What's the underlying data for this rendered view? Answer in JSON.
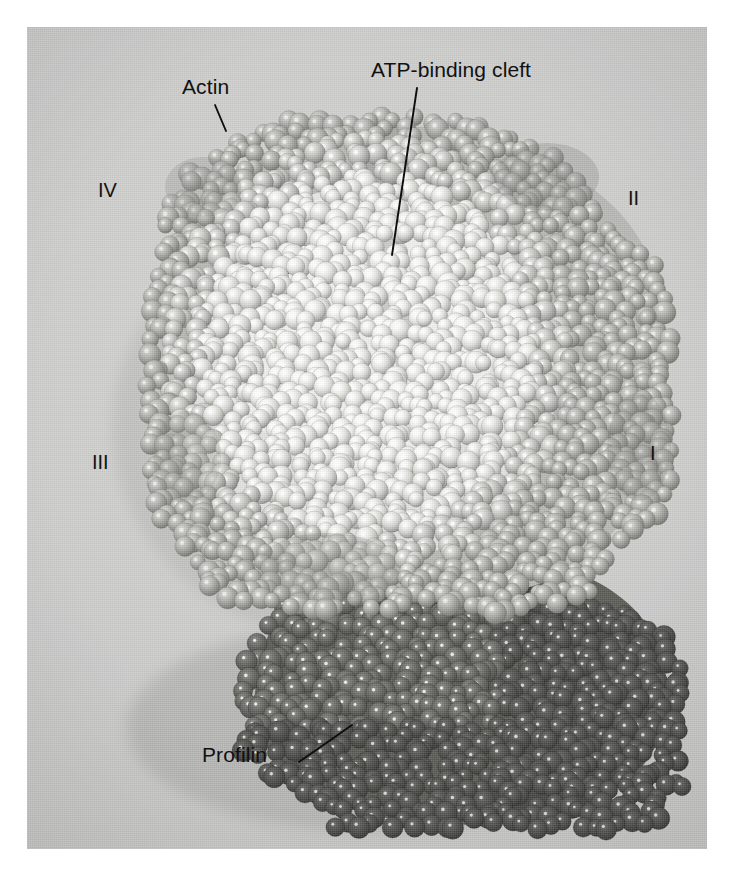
{
  "figure": {
    "kind": "space-filling molecular model photograph",
    "plate": {
      "background_color": "#cbcbc9",
      "left": 27,
      "top": 27,
      "width": 680,
      "height": 822
    }
  },
  "annotations": [
    {
      "id": "actin",
      "label": "Actin",
      "text_x": 182,
      "text_y": 76,
      "leader": {
        "x1": 215,
        "y1": 105,
        "x2": 226,
        "y2": 131
      }
    },
    {
      "id": "atp-binding-cleft",
      "label": "ATP-binding cleft",
      "text_x": 371,
      "text_y": 59,
      "leader": {
        "x1": 417,
        "y1": 88,
        "x2": 392,
        "y2": 255
      }
    },
    {
      "id": "profilin",
      "label": "Profilin",
      "text_x": 202,
      "text_y": 744,
      "leader": {
        "x1": 299,
        "y1": 762,
        "x2": 352,
        "y2": 725
      }
    }
  ],
  "domain_labels": [
    {
      "id": "domain-iv",
      "label": "IV",
      "x": 98,
      "y": 180
    },
    {
      "id": "domain-ii",
      "label": "II",
      "x": 628,
      "y": 188
    },
    {
      "id": "domain-iii",
      "label": "III",
      "x": 92,
      "y": 452
    },
    {
      "id": "domain-i",
      "label": "I",
      "x": 650,
      "y": 443
    }
  ],
  "colors": {
    "plate_background": "#cbcbc9",
    "actin_light": "#f4f4f2",
    "actin_mid": "#c9c9c6",
    "actin_shadow": "#9a9a97",
    "profilin_dark": "#5d5d5c",
    "profilin_darker": "#434342",
    "profilin_highlight": "#e8e8e6",
    "annotation_text": "#111111",
    "leader_line": "#0e0e0e",
    "page_margin": "#ffffff"
  },
  "structure": {
    "actin_subunit_label": "Actin",
    "profilin_subunit_label": "Profilin",
    "cleft_label": "ATP-binding cleft",
    "domain_numerals": [
      "I",
      "II",
      "III",
      "IV"
    ]
  }
}
